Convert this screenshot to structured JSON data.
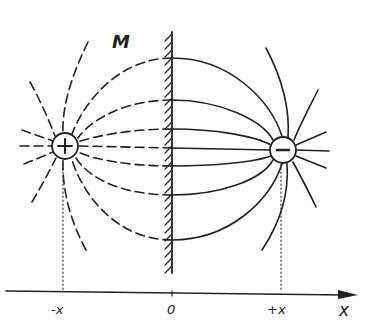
{
  "diagram": {
    "mirror_label": "M",
    "charges": [
      {
        "name": "real-charge",
        "sign": "+",
        "symbol": "+",
        "position_label": "-x",
        "line_style": "dashed"
      },
      {
        "name": "image-charge",
        "sign": "-",
        "symbol": "−",
        "position_label": "+x",
        "line_style": "solid"
      }
    ],
    "axis": {
      "label": "x",
      "ticks": [
        {
          "label": "-x"
        },
        {
          "label": "0"
        },
        {
          "label": "+x"
        }
      ]
    },
    "colors": {
      "ink": "#222222",
      "background": "#ffffff"
    }
  }
}
